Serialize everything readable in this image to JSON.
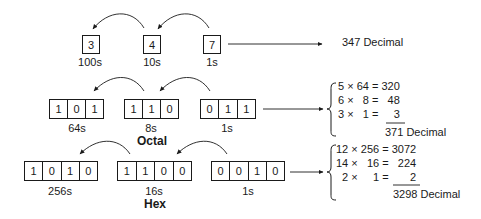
{
  "decimal": {
    "digits": [
      "3",
      "4",
      "7"
    ],
    "place_labels": [
      "100s",
      "10s",
      "1s"
    ],
    "result": "347 Decimal"
  },
  "octal": {
    "title": "Octal",
    "groups": [
      {
        "bits": [
          "1",
          "0",
          "1"
        ],
        "place_label": "64s"
      },
      {
        "bits": [
          "1",
          "1",
          "0"
        ],
        "place_label": "8s"
      },
      {
        "bits": [
          "0",
          "1",
          "1"
        ],
        "place_label": "1s"
      }
    ],
    "calculation": [
      "5 × 64 = 320",
      "6 ×   8 =   48",
      "3 ×   1 =     3"
    ],
    "result": "371 Decimal"
  },
  "hex": {
    "title": "Hex",
    "groups": [
      {
        "bits": [
          "1",
          "0",
          "1",
          "0"
        ],
        "place_label": "256s"
      },
      {
        "bits": [
          "1",
          "1",
          "0",
          "0"
        ],
        "place_label": "16s"
      },
      {
        "bits": [
          "0",
          "0",
          "1",
          "0"
        ],
        "place_label": "1s"
      }
    ],
    "calculation": [
      "12 × 256 = 3072",
      "14 ×   16 =   224",
      "  2 ×     1 =       2"
    ],
    "result": "3298 Decimal"
  },
  "colors": {
    "ink": "#1a1a1a",
    "background": "#ffffff"
  }
}
